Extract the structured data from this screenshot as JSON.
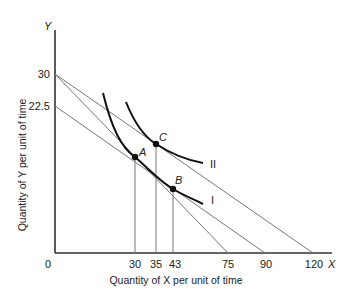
{
  "diagram": {
    "type": "indifference-curve-budget-line",
    "axes": {
      "x_letter": "X",
      "y_letter": "Y",
      "x_label": "Quantity of X per unit of time",
      "y_label": "Quantity of Y per unit of time",
      "origin_label": "0",
      "x_ticks": [
        "30",
        "35",
        "43",
        "75",
        "90",
        "120"
      ],
      "y_ticks": [
        "30",
        "22.5"
      ]
    },
    "budget_lines": [
      {
        "name": "budget-line-30-120",
        "y_intercept": 30,
        "x_intercept": 120
      },
      {
        "name": "budget-line-30-75",
        "y_intercept": 30,
        "x_intercept": 75
      },
      {
        "name": "budget-line-22.5-90",
        "y_intercept": 22.5,
        "x_intercept": 90
      }
    ],
    "indifference_curves": [
      {
        "label": "I"
      },
      {
        "label": "II"
      }
    ],
    "points": [
      {
        "label": "A",
        "x": 30,
        "curve": "I"
      },
      {
        "label": "B",
        "x": 43,
        "curve": "I"
      },
      {
        "label": "C",
        "x": 35,
        "curve": "II"
      }
    ],
    "colors": {
      "axis": "#333333",
      "budget_line": "#777777",
      "curve": "#111111",
      "drop_line": "#777777"
    }
  }
}
